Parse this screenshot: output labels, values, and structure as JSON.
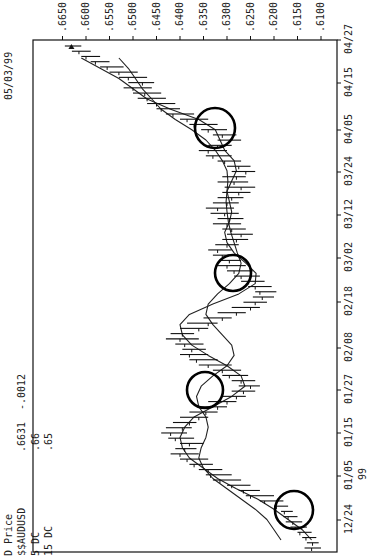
{
  "header": {
    "date": "05/03/99",
    "study": "D Price",
    "symbol": "$$AUDUSD",
    "last": ".6631",
    "change": "-.0012",
    "indicators": [
      {
        "label": "5 DC",
        "value": ".66"
      },
      {
        "label": "15 DC",
        "value": ".65"
      }
    ],
    "year_label": "99"
  },
  "chart_data": {
    "type": "ohlc",
    "title": "D Price $$AUDUSD .6631 -.0012",
    "orientation": "rotated 90deg clockwise (time runs bottom-to-top, price increases right-to-left)",
    "xlabel": "Date (1999)",
    "ylabel": "Price",
    "ylim": [
      0.6085,
      0.6665
    ],
    "y_ticks": [
      ".6650",
      ".6600",
      ".6550",
      ".6500",
      ".6450",
      ".6400",
      ".6350",
      ".6300",
      ".6250",
      ".6200",
      ".6150",
      ".6100"
    ],
    "x_ticks": [
      "12/24",
      "01/05",
      "01/15",
      "01/27",
      "02/08",
      "02/18",
      "03/02",
      "03/12",
      "03/24",
      "04/05",
      "04/15",
      "04/27"
    ],
    "legend": [
      "5 DC (.66)",
      "15 DC (.65)"
    ],
    "grid": false,
    "bars": [
      {
        "h": 0.6135,
        "l": 0.61,
        "c": 0.612
      },
      {
        "h": 0.613,
        "l": 0.6105,
        "c": 0.6118
      },
      {
        "h": 0.614,
        "l": 0.611,
        "c": 0.6132
      },
      {
        "h": 0.615,
        "l": 0.612,
        "c": 0.6145
      },
      {
        "h": 0.6165,
        "l": 0.613,
        "c": 0.6155
      },
      {
        "h": 0.6175,
        "l": 0.614,
        "c": 0.616
      },
      {
        "h": 0.618,
        "l": 0.615,
        "c": 0.617
      },
      {
        "h": 0.6185,
        "l": 0.616,
        "c": 0.6178
      },
      {
        "h": 0.62,
        "l": 0.617,
        "c": 0.6195
      },
      {
        "h": 0.623,
        "l": 0.618,
        "c": 0.622
      },
      {
        "h": 0.626,
        "l": 0.62,
        "c": 0.625
      },
      {
        "h": 0.6275,
        "l": 0.623,
        "c": 0.6265
      },
      {
        "h": 0.63,
        "l": 0.625,
        "c": 0.629
      },
      {
        "h": 0.633,
        "l": 0.627,
        "c": 0.6315
      },
      {
        "h": 0.6345,
        "l": 0.629,
        "c": 0.6335
      },
      {
        "h": 0.636,
        "l": 0.631,
        "c": 0.634
      },
      {
        "h": 0.638,
        "l": 0.633,
        "c": 0.637
      },
      {
        "h": 0.64,
        "l": 0.634,
        "c": 0.6385
      },
      {
        "h": 0.642,
        "l": 0.636,
        "c": 0.64
      },
      {
        "h": 0.641,
        "l": 0.6365,
        "c": 0.639
      },
      {
        "h": 0.64,
        "l": 0.635,
        "c": 0.638
      },
      {
        "h": 0.6425,
        "l": 0.637,
        "c": 0.641
      },
      {
        "h": 0.644,
        "l": 0.6385,
        "c": 0.642
      },
      {
        "h": 0.643,
        "l": 0.6375,
        "c": 0.6395
      },
      {
        "h": 0.6415,
        "l": 0.6365,
        "c": 0.638
      },
      {
        "h": 0.64,
        "l": 0.634,
        "c": 0.636
      },
      {
        "h": 0.638,
        "l": 0.632,
        "c": 0.6345
      },
      {
        "h": 0.636,
        "l": 0.63,
        "c": 0.632
      },
      {
        "h": 0.634,
        "l": 0.628,
        "c": 0.63
      },
      {
        "h": 0.631,
        "l": 0.626,
        "c": 0.628
      },
      {
        "h": 0.629,
        "l": 0.624,
        "c": 0.6265
      },
      {
        "h": 0.6275,
        "l": 0.623,
        "c": 0.625
      },
      {
        "h": 0.629,
        "l": 0.624,
        "c": 0.627
      },
      {
        "h": 0.631,
        "l": 0.6255,
        "c": 0.6295
      },
      {
        "h": 0.633,
        "l": 0.627,
        "c": 0.631
      },
      {
        "h": 0.636,
        "l": 0.629,
        "c": 0.634
      },
      {
        "h": 0.638,
        "l": 0.632,
        "c": 0.6365
      },
      {
        "h": 0.64,
        "l": 0.634,
        "c": 0.638
      },
      {
        "h": 0.6395,
        "l": 0.6345,
        "c": 0.6375
      },
      {
        "h": 0.641,
        "l": 0.635,
        "c": 0.639
      },
      {
        "h": 0.643,
        "l": 0.636,
        "c": 0.64
      },
      {
        "h": 0.642,
        "l": 0.637,
        "c": 0.6395
      },
      {
        "h": 0.64,
        "l": 0.634,
        "c": 0.636
      },
      {
        "h": 0.6385,
        "l": 0.632,
        "c": 0.634
      },
      {
        "h": 0.635,
        "l": 0.629,
        "c": 0.631
      },
      {
        "h": 0.632,
        "l": 0.626,
        "c": 0.628
      },
      {
        "h": 0.629,
        "l": 0.623,
        "c": 0.625
      },
      {
        "h": 0.6265,
        "l": 0.6215,
        "c": 0.624
      },
      {
        "h": 0.6245,
        "l": 0.62,
        "c": 0.6225
      },
      {
        "h": 0.624,
        "l": 0.6195,
        "c": 0.623
      },
      {
        "h": 0.6255,
        "l": 0.6205,
        "c": 0.624
      },
      {
        "h": 0.627,
        "l": 0.622,
        "c": 0.6255
      },
      {
        "h": 0.6285,
        "l": 0.623,
        "c": 0.627
      },
      {
        "h": 0.63,
        "l": 0.6245,
        "c": 0.6285
      },
      {
        "h": 0.632,
        "l": 0.626,
        "c": 0.63
      },
      {
        "h": 0.6315,
        "l": 0.627,
        "c": 0.6295
      },
      {
        "h": 0.633,
        "l": 0.628,
        "c": 0.631
      },
      {
        "h": 0.634,
        "l": 0.629,
        "c": 0.632
      },
      {
        "h": 0.6325,
        "l": 0.6275,
        "c": 0.63
      },
      {
        "h": 0.631,
        "l": 0.6255,
        "c": 0.628
      },
      {
        "h": 0.63,
        "l": 0.6245,
        "c": 0.627
      },
      {
        "h": 0.631,
        "l": 0.626,
        "c": 0.629
      },
      {
        "h": 0.633,
        "l": 0.627,
        "c": 0.63
      },
      {
        "h": 0.632,
        "l": 0.6265,
        "c": 0.6295
      },
      {
        "h": 0.6335,
        "l": 0.6275,
        "c": 0.6305
      },
      {
        "h": 0.6345,
        "l": 0.6285,
        "c": 0.632
      },
      {
        "h": 0.633,
        "l": 0.6275,
        "c": 0.63
      },
      {
        "h": 0.632,
        "l": 0.6265,
        "c": 0.629
      },
      {
        "h": 0.631,
        "l": 0.625,
        "c": 0.6275
      },
      {
        "h": 0.6305,
        "l": 0.624,
        "c": 0.627
      },
      {
        "h": 0.632,
        "l": 0.6255,
        "c": 0.6285
      },
      {
        "h": 0.631,
        "l": 0.626,
        "c": 0.628
      },
      {
        "h": 0.629,
        "l": 0.624,
        "c": 0.626
      },
      {
        "h": 0.63,
        "l": 0.625,
        "c": 0.6275
      },
      {
        "h": 0.632,
        "l": 0.627,
        "c": 0.6305
      },
      {
        "h": 0.6345,
        "l": 0.629,
        "c": 0.633
      },
      {
        "h": 0.636,
        "l": 0.63,
        "c": 0.634
      },
      {
        "h": 0.634,
        "l": 0.629,
        "c": 0.632
      },
      {
        "h": 0.632,
        "l": 0.627,
        "c": 0.6295
      },
      {
        "h": 0.633,
        "l": 0.628,
        "c": 0.631
      },
      {
        "h": 0.6355,
        "l": 0.63,
        "c": 0.634
      },
      {
        "h": 0.638,
        "l": 0.632,
        "c": 0.637
      },
      {
        "h": 0.64,
        "l": 0.634,
        "c": 0.6385
      },
      {
        "h": 0.643,
        "l": 0.637,
        "c": 0.6415
      },
      {
        "h": 0.645,
        "l": 0.64,
        "c": 0.644
      },
      {
        "h": 0.647,
        "l": 0.641,
        "c": 0.645
      },
      {
        "h": 0.649,
        "l": 0.643,
        "c": 0.647
      },
      {
        "h": 0.65,
        "l": 0.644,
        "c": 0.6475
      },
      {
        "h": 0.652,
        "l": 0.646,
        "c": 0.65
      },
      {
        "h": 0.651,
        "l": 0.6455,
        "c": 0.648
      },
      {
        "h": 0.653,
        "l": 0.647,
        "c": 0.651
      },
      {
        "h": 0.655,
        "l": 0.649,
        "c": 0.653
      },
      {
        "h": 0.657,
        "l": 0.652,
        "c": 0.6555
      },
      {
        "h": 0.659,
        "l": 0.655,
        "c": 0.658
      },
      {
        "h": 0.661,
        "l": 0.657,
        "c": 0.66
      },
      {
        "h": 0.663,
        "l": 0.659,
        "c": 0.6615
      },
      {
        "h": 0.6645,
        "l": 0.661,
        "c": 0.6631
      }
    ],
    "ma5": [
      0.612,
      0.614,
      0.617,
      0.62,
      0.6235,
      0.628,
      0.632,
      0.635,
      0.638,
      0.6395,
      0.64,
      0.639,
      0.637,
      0.633,
      0.629,
      0.6262,
      0.627,
      0.63,
      0.634,
      0.6375,
      0.6395,
      0.64,
      0.638,
      0.633,
      0.6275,
      0.624,
      0.6238,
      0.626,
      0.6285,
      0.63,
      0.6305,
      0.6295,
      0.629,
      0.6295,
      0.63,
      0.629,
      0.628,
      0.6285,
      0.6305,
      0.6315,
      0.6325,
      0.636,
      0.642,
      0.647,
      0.65,
      0.653,
      0.657,
      0.661
    ],
    "ma15": [
      0.6185,
      0.62,
      0.6215,
      0.624,
      0.627,
      0.63,
      0.633,
      0.635,
      0.636,
      0.6355,
      0.6345,
      0.634,
      0.6345,
      0.636,
      0.6365,
      0.6355,
      0.633,
      0.63,
      0.6285,
      0.629,
      0.631,
      0.633,
      0.6345,
      0.634,
      0.632,
      0.6295,
      0.6275,
      0.627,
      0.6278,
      0.6285,
      0.6292,
      0.6297,
      0.63,
      0.6302,
      0.63,
      0.6298,
      0.63,
      0.631,
      0.6325,
      0.6345,
      0.6375,
      0.641,
      0.644,
      0.646,
      0.648,
      0.6495,
      0.651,
      0.653
    ],
    "annotations": [
      {
        "type": "circle",
        "label": "MA crossover",
        "date_approx": "01/01",
        "price_approx": 0.6195
      },
      {
        "type": "circle",
        "label": "MA crossover",
        "date_approx": "01/23",
        "price_approx": 0.635
      },
      {
        "type": "circle",
        "label": "MA crossover",
        "date_approx": "03/03",
        "price_approx": 0.629
      },
      {
        "type": "circle",
        "label": "MA crossover",
        "date_approx": "04/08",
        "price_approx": 0.633
      }
    ],
    "last_marker": {
      "type": "triangle",
      "price": 0.6631
    }
  },
  "colors": {
    "background": "#ffffff",
    "ink": "#111111",
    "circle": "#000000"
  }
}
